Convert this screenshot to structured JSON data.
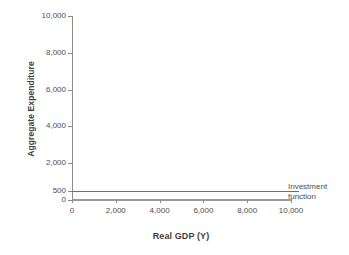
{
  "chart_data": {
    "type": "line",
    "title": "",
    "xlabel": "Real GDP (Y)",
    "ylabel": "Aggregate Expenditure",
    "xlim": [
      0,
      10000
    ],
    "ylim": [
      0,
      10000
    ],
    "grid": false,
    "legend_position": "right-of-plot",
    "x_ticks": [
      {
        "value": 0,
        "label": "0"
      },
      {
        "value": 2000,
        "label": "2,000"
      },
      {
        "value": 4000,
        "label": "4,000"
      },
      {
        "value": 6000,
        "label": "6,000"
      },
      {
        "value": 8000,
        "label": "8,000"
      },
      {
        "value": 10000,
        "label": "10,000"
      }
    ],
    "y_ticks": [
      {
        "value": 0,
        "label": "0"
      },
      {
        "value": 500,
        "label": "500"
      },
      {
        "value": 2000,
        "label": "2,000"
      },
      {
        "value": 4000,
        "label": "4,000"
      },
      {
        "value": 6000,
        "label": "6,000"
      },
      {
        "value": 8000,
        "label": "8,000"
      },
      {
        "value": 10000,
        "label": "10,000"
      }
    ],
    "series": [
      {
        "name": "Investment function",
        "annotation_line1": "Investment",
        "annotation_line2": "function",
        "color": "#6f6f6f",
        "x": [
          0,
          2000,
          4000,
          6000,
          8000,
          10000
        ],
        "values": [
          500,
          500,
          500,
          500,
          500,
          500
        ]
      }
    ]
  },
  "colors": {
    "axis": "#8c8c8c",
    "text": "#4d4d4d",
    "series": "#6f6f6f",
    "background": "#ffffff"
  }
}
